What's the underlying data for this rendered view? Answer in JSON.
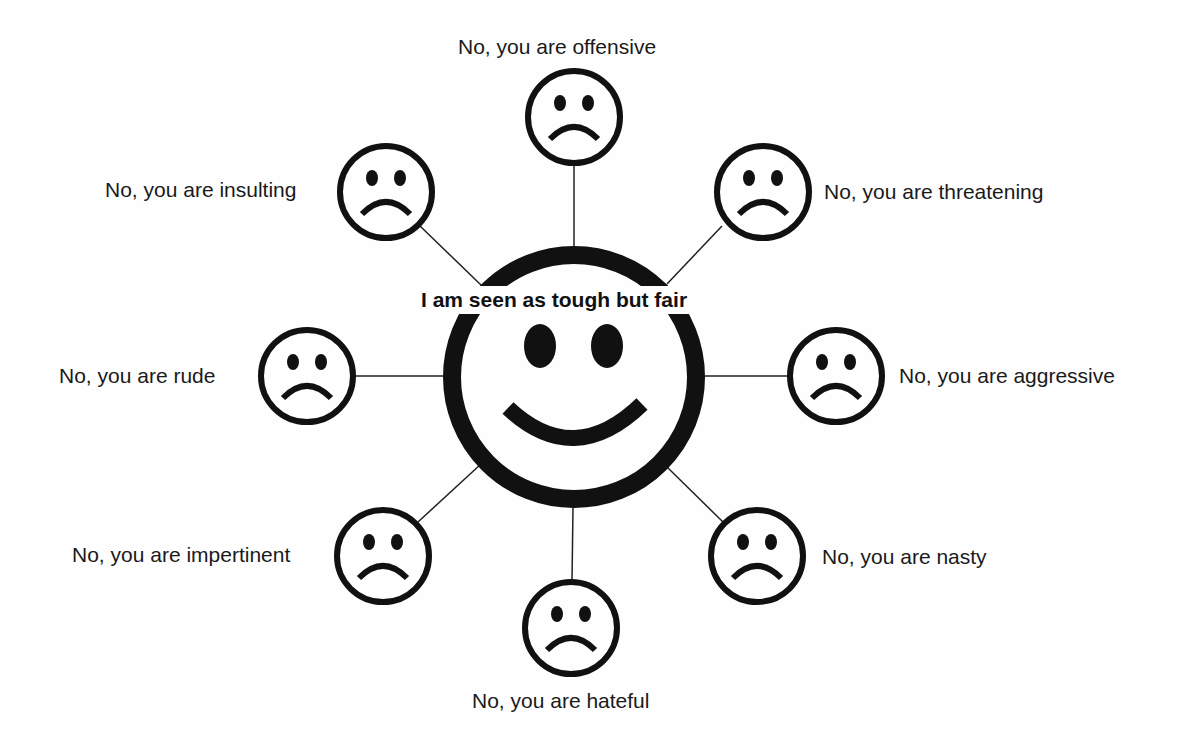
{
  "diagram": {
    "center": {
      "label": "I am seen as tough but fair",
      "face": "smiley-face"
    },
    "spokes": [
      {
        "id": "offensive",
        "label": "No, you are offensive",
        "face": "sad-face"
      },
      {
        "id": "threatening",
        "label": "No, you are threatening",
        "face": "sad-face"
      },
      {
        "id": "aggressive",
        "label": "No, you are aggressive",
        "face": "sad-face"
      },
      {
        "id": "nasty",
        "label": "No, you are nasty",
        "face": "sad-face"
      },
      {
        "id": "hateful",
        "label": "No, you are hateful",
        "face": "sad-face"
      },
      {
        "id": "impertinent",
        "label": "No, you are impertinent",
        "face": "sad-face"
      },
      {
        "id": "rude",
        "label": "No, you are rude",
        "face": "sad-face"
      },
      {
        "id": "insulting",
        "label": "No, you are insulting",
        "face": "sad-face"
      }
    ],
    "colors": {
      "ink": "#111111",
      "background": "#fefefe"
    }
  }
}
